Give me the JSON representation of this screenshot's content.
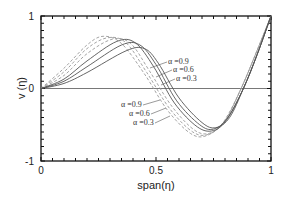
{
  "chart_data": {
    "type": "line",
    "title": "",
    "xlabel": "span(η)",
    "ylabel": "v (η)",
    "xlim": [
      0,
      1
    ],
    "ylim": [
      -1,
      1
    ],
    "xticks": [
      0,
      0.5,
      1
    ],
    "xtick_labels": [
      "0",
      "0.5",
      "1"
    ],
    "yticks": [
      -1,
      0,
      1
    ],
    "ytick_labels": [
      "-1",
      "0",
      "1"
    ],
    "grid": false,
    "legend": "none (inline annotations)",
    "reference_line": {
      "y": 0
    },
    "series": [
      {
        "name": "α =0.3 (dashed)",
        "style": "dashed",
        "x": [
          0,
          0.1,
          0.2,
          0.27,
          0.35,
          0.45,
          0.55,
          0.65,
          0.72,
          0.8,
          0.87,
          0.93,
          1.0
        ],
        "y": [
          0,
          0.28,
          0.6,
          0.72,
          0.62,
          0.2,
          -0.3,
          -0.62,
          -0.65,
          -0.45,
          0.0,
          0.45,
          1.0
        ]
      },
      {
        "name": "α =0.6 (dashed)",
        "style": "dashed",
        "x": [
          0,
          0.1,
          0.2,
          0.29,
          0.37,
          0.46,
          0.56,
          0.66,
          0.73,
          0.8,
          0.87,
          0.93,
          1.0
        ],
        "y": [
          0,
          0.23,
          0.55,
          0.7,
          0.63,
          0.22,
          -0.28,
          -0.6,
          -0.63,
          -0.44,
          0.0,
          0.45,
          1.0
        ]
      },
      {
        "name": "α =0.9 (dashed)",
        "style": "dashed",
        "x": [
          0,
          0.1,
          0.2,
          0.31,
          0.39,
          0.47,
          0.57,
          0.67,
          0.74,
          0.8,
          0.87,
          0.93,
          1.0
        ],
        "y": [
          0,
          0.18,
          0.48,
          0.68,
          0.62,
          0.25,
          -0.25,
          -0.58,
          -0.61,
          -0.43,
          0.0,
          0.45,
          1.0
        ]
      },
      {
        "name": "α =0.9 (solid)",
        "style": "solid",
        "x": [
          0,
          0.1,
          0.2,
          0.33,
          0.41,
          0.49,
          0.58,
          0.68,
          0.75,
          0.81,
          0.88,
          0.94,
          1.0
        ],
        "y": [
          0,
          0.13,
          0.38,
          0.65,
          0.63,
          0.3,
          -0.2,
          -0.53,
          -0.58,
          -0.42,
          0.0,
          0.47,
          1.0
        ]
      },
      {
        "name": "α =0.6 (solid)",
        "style": "solid",
        "x": [
          0,
          0.1,
          0.2,
          0.35,
          0.43,
          0.5,
          0.59,
          0.69,
          0.75,
          0.81,
          0.88,
          0.94,
          1.0
        ],
        "y": [
          0,
          0.1,
          0.3,
          0.6,
          0.6,
          0.33,
          -0.17,
          -0.5,
          -0.56,
          -0.41,
          0.0,
          0.47,
          1.0
        ]
      },
      {
        "name": "α =0.3 (solid)",
        "style": "solid",
        "x": [
          0,
          0.1,
          0.2,
          0.37,
          0.45,
          0.51,
          0.6,
          0.7,
          0.76,
          0.82,
          0.88,
          0.94,
          1.0
        ],
        "y": [
          0,
          0.07,
          0.22,
          0.52,
          0.55,
          0.35,
          -0.13,
          -0.47,
          -0.54,
          -0.4,
          0.0,
          0.47,
          1.0
        ]
      }
    ],
    "annotations": [
      {
        "text": "α =0.9",
        "group": "upper",
        "x": 0.58,
        "y": 0.25
      },
      {
        "text": "α =0.6",
        "group": "upper",
        "x": 0.63,
        "y": 0.11
      },
      {
        "text": "α =0.3",
        "group": "upper",
        "x": 0.66,
        "y": -0.02
      },
      {
        "text": "α =0.9",
        "group": "lower",
        "x": 0.4,
        "y": -0.3
      },
      {
        "text": "α =0.6",
        "group": "lower",
        "x": 0.46,
        "y": -0.43
      },
      {
        "text": "α =0.3",
        "group": "lower",
        "x": 0.49,
        "y": -0.55
      }
    ]
  },
  "labels": {
    "xlabel": "span(η)",
    "ylabel": "v (η)",
    "x0": "0",
    "x05": "0.5",
    "x1": "1",
    "ym1": "-1",
    "y0": "0",
    "y1": "1",
    "a_up_09": "α =0.9",
    "a_up_06": "α =0.6",
    "a_up_03": "α =0.3",
    "a_lo_09": "α =0.9",
    "a_lo_06": "α =0.6",
    "a_lo_03": "α =0.3"
  }
}
